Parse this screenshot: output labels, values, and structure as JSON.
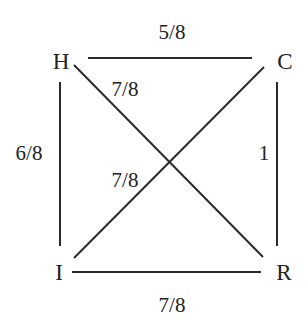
{
  "diagram": {
    "type": "weighted-graph",
    "nodes": [
      {
        "id": "H",
        "label": "H",
        "x": 61,
        "y": 61
      },
      {
        "id": "C",
        "label": "C",
        "x": 285,
        "y": 61
      },
      {
        "id": "I",
        "label": "I",
        "x": 59,
        "y": 272
      },
      {
        "id": "R",
        "label": "R",
        "x": 284,
        "y": 272
      }
    ],
    "edges": [
      {
        "from": "H",
        "to": "C",
        "weight": "5/8",
        "x1": 88,
        "y1": 58,
        "x2": 252,
        "y2": 58,
        "lx": 172,
        "ly": 32
      },
      {
        "from": "H",
        "to": "R",
        "weight": "7/8",
        "x1": 74,
        "y1": 65,
        "x2": 263,
        "y2": 257,
        "lx": 125,
        "ly": 89
      },
      {
        "from": "H",
        "to": "I",
        "weight": "6/8",
        "x1": 60,
        "y1": 82,
        "x2": 60,
        "y2": 246,
        "lx": 29,
        "ly": 153
      },
      {
        "from": "C",
        "to": "R",
        "weight": "1",
        "x1": 277,
        "y1": 82,
        "x2": 277,
        "y2": 246,
        "lx": 264,
        "ly": 153
      },
      {
        "from": "C",
        "to": "I",
        "weight": "7/8",
        "x1": 264,
        "y1": 67,
        "x2": 74,
        "y2": 258,
        "lx": 125,
        "ly": 180
      },
      {
        "from": "I",
        "to": "R",
        "weight": "7/8",
        "x1": 72,
        "y1": 272,
        "x2": 261,
        "y2": 272,
        "lx": 172,
        "ly": 305
      }
    ]
  },
  "labels": {
    "node_H": "H",
    "node_C": "C",
    "node_I": "I",
    "node_R": "R",
    "edge_HC": "5/8",
    "edge_HR": "7/8",
    "edge_HI": "6/8",
    "edge_CR": "1",
    "edge_CI": "7/8",
    "edge_IR": "7/8"
  },
  "colors": {
    "line": "#2a2a2a",
    "text": "#222222",
    "background": "#ffffff"
  }
}
